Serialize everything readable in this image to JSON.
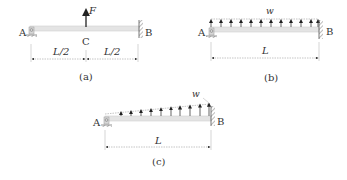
{
  "figure": {
    "panels": [
      {
        "id": "a",
        "caption": "(a)",
        "support_left": "A",
        "support_right": "B",
        "midpoint": "C",
        "load_label": "F",
        "load_type": "point force upward at midspan",
        "dimensions": [
          "L/2",
          "L/2"
        ]
      },
      {
        "id": "b",
        "caption": "(b)",
        "support_left": "A",
        "support_right": "B",
        "load_label": "w",
        "load_type": "uniform distributed load upward",
        "dimensions": [
          "L"
        ]
      },
      {
        "id": "c",
        "caption": "(c)",
        "support_left": "A",
        "support_right": "B",
        "load_label": "w",
        "load_type": "linearly increasing distributed load upward",
        "dimensions": [
          "L"
        ]
      }
    ],
    "colors": {
      "beam": "#e4e4e4",
      "beam_edge": "#c8c8c8",
      "line": "#333333",
      "dim": "#555555",
      "wall_hatch": "#777777"
    }
  }
}
